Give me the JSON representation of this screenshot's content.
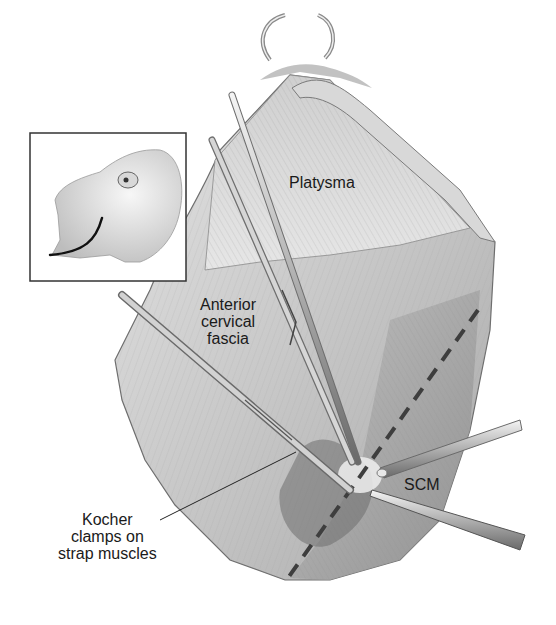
{
  "figure": {
    "labels": {
      "platysma": "Platysma",
      "anterior_cervical_fascia": "Anterior\ncervical\nfascia",
      "scm": "SCM",
      "kocher_clamps": "Kocher\nclamps on\nstrap muscles"
    },
    "inset": {
      "content": "head-profile-with-incision-line"
    },
    "instruments": [
      "ring-retractor",
      "hemostat-forceps",
      "kocher-clamp-upper",
      "kocher-clamp-lower",
      "retractor-right-upper",
      "retractor-right-lower"
    ],
    "colors": {
      "tissue_light": "#dcdcdc",
      "tissue_mid": "#b8b8b8",
      "tissue_dark": "#7a7a7a",
      "instrument": "#9a9a9a",
      "outline": "#555555",
      "dashed_line": "#444444",
      "text": "#1a1a1a"
    }
  }
}
